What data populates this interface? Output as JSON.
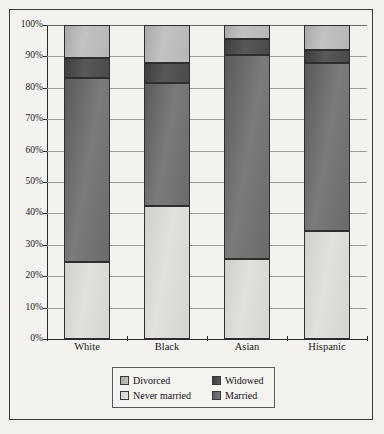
{
  "chart_data": {
    "type": "bar",
    "subtype": "stacked-bar-100-percent",
    "title": "",
    "xlabel": "",
    "ylabel": "",
    "categories": [
      "White",
      "Black",
      "Asian",
      "Hispanic"
    ],
    "ylim": [
      0,
      100
    ],
    "ytick_labels": [
      "0%",
      "10%",
      "20%",
      "30%",
      "40%",
      "50%",
      "60%",
      "70%",
      "80%",
      "90%",
      "100%"
    ],
    "ytick_values": [
      0,
      10,
      20,
      30,
      40,
      50,
      60,
      70,
      80,
      90,
      100
    ],
    "grid": true,
    "legend_position": "bottom",
    "stack_order_bottom_to_top": [
      "Never married",
      "Married",
      "Widowed",
      "Divorced"
    ],
    "series": [
      {
        "name": "Never married",
        "color": "#d8d8d5",
        "values": [
          24.5,
          42.5,
          25.5,
          34.5
        ]
      },
      {
        "name": "Married",
        "color": "#6e6e6e",
        "values": [
          58.5,
          39.0,
          65.0,
          53.5
        ]
      },
      {
        "name": "Widowed",
        "color": "#4a4a4a",
        "values": [
          6.5,
          6.5,
          5.0,
          4.0
        ]
      },
      {
        "name": "Divorced",
        "color": "#b8b8b8",
        "values": [
          10.5,
          12.0,
          4.5,
          8.0
        ]
      }
    ],
    "cumulative_tops": {
      "White": {
        "never_married": 24.5,
        "married": 83.0,
        "widowed": 89.5,
        "divorced": 100
      },
      "Black": {
        "never_married": 42.5,
        "married": 81.5,
        "widowed": 88.0,
        "divorced": 100
      },
      "Asian": {
        "never_married": 25.5,
        "married": 90.5,
        "widowed": 95.5,
        "divorced": 100
      },
      "Hispanic": {
        "never_married": 34.5,
        "married": 88.0,
        "widowed": 92.0,
        "divorced": 100
      }
    }
  },
  "axis": {
    "y_ticks": [
      {
        "label": "100%",
        "value": 100
      },
      {
        "label": "90%",
        "value": 90
      },
      {
        "label": "80%",
        "value": 80
      },
      {
        "label": "70%",
        "value": 70
      },
      {
        "label": "60%",
        "value": 60
      },
      {
        "label": "50%",
        "value": 50
      },
      {
        "label": "40%",
        "value": 40
      },
      {
        "label": "30%",
        "value": 30
      },
      {
        "label": "20%",
        "value": 20
      },
      {
        "label": "10%",
        "value": 10
      },
      {
        "label": "0%",
        "value": 0
      }
    ],
    "x_labels": [
      "White",
      "Black",
      "Asian",
      "Hispanic"
    ]
  },
  "legend": {
    "rows": [
      {
        "left": {
          "label": "Divorced",
          "swatch": "divorced"
        },
        "right": {
          "label": "Widowed",
          "swatch": "widowed"
        }
      },
      {
        "left": {
          "label": "Never married",
          "swatch": "nevermarried"
        },
        "right": {
          "label": "Married",
          "swatch": "married"
        }
      }
    ]
  }
}
